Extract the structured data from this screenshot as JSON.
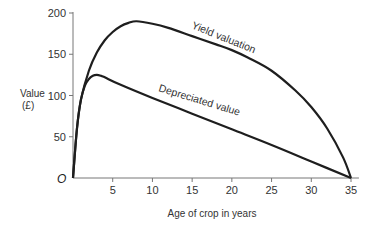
{
  "chart_data": {
    "type": "line",
    "title": "",
    "xlabel": "Age of crop in years",
    "ylabel": "Value",
    "ylabel_unit": "(£)",
    "origin_label": "O",
    "xlim": [
      0,
      36
    ],
    "ylim": [
      0,
      200
    ],
    "xticks": [
      5,
      10,
      15,
      20,
      25,
      30,
      35
    ],
    "yticks": [
      50,
      100,
      150,
      200
    ],
    "grid": false,
    "legend": "inline labels on curves",
    "series": [
      {
        "name": "Yield valuation",
        "x": [
          0,
          0.5,
          1,
          2,
          3,
          4,
          5,
          6,
          7,
          8,
          10,
          12,
          15,
          18,
          20,
          22,
          25,
          28,
          30,
          32,
          34,
          35
        ],
        "values": [
          0,
          60,
          95,
          130,
          152,
          167,
          177,
          184,
          188,
          190,
          187,
          182,
          172,
          162,
          155,
          146,
          130,
          106,
          86,
          60,
          25,
          0
        ]
      },
      {
        "name": "Depreciated value",
        "x": [
          0,
          0.5,
          1,
          1.5,
          2,
          2.5,
          3,
          3.5,
          4,
          6,
          10,
          15,
          20,
          25,
          30,
          35
        ],
        "values": [
          0,
          60,
          95,
          112,
          120,
          124,
          125,
          124,
          122,
          113,
          97,
          78,
          59,
          40,
          20,
          0
        ]
      }
    ]
  }
}
